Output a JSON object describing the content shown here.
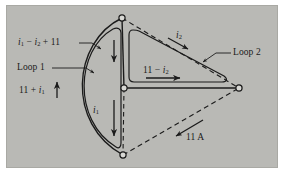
{
  "figure": {
    "type": "circuit-mesh-diagram",
    "background_color": "#b9b9b5",
    "line_color": "#1b1b1b",
    "panel": {
      "x": 6,
      "y": 5,
      "width": 272,
      "height": 163
    },
    "nodes": [
      {
        "name": "top-node",
        "x": 122,
        "y": 18
      },
      {
        "name": "center-node",
        "x": 124,
        "y": 88
      },
      {
        "name": "bottom-node",
        "x": 123,
        "y": 155
      },
      {
        "name": "right-node",
        "x": 239,
        "y": 88
      }
    ],
    "branches": [
      {
        "name": "left-arc-outer",
        "style": "solid",
        "from": "top-node",
        "to": "bottom-node"
      },
      {
        "name": "vertical-trunk",
        "style": "solid",
        "from": "top-node",
        "to": "center-node"
      },
      {
        "name": "center-to-right",
        "style": "solid",
        "from": "center-node",
        "to": "right-node"
      },
      {
        "name": "top-to-right",
        "style": "dashed",
        "from": "top-node",
        "to": "right-node"
      },
      {
        "name": "bottom-to-right",
        "style": "dashed",
        "from": "bottom-node",
        "to": "right-node"
      },
      {
        "name": "center-to-bottom",
        "style": "dashed",
        "from": "center-node",
        "to": "bottom-node"
      }
    ],
    "loops": [
      {
        "name": "loop-1",
        "shape": "lens-arc",
        "label": "Loop 1"
      },
      {
        "name": "loop-2",
        "shape": "rounded-triangle",
        "label": "Loop 2"
      }
    ],
    "labels": {
      "i1_minus_i2_plus_11": {
        "text": "i₁ − i₂ + 11",
        "parts": [
          "i",
          "1",
          " − ",
          "i",
          "2",
          " + 11"
        ]
      },
      "loop1": "Loop 1",
      "eleven_plus_i1": "11 + i₁",
      "i1": "i₁",
      "eleven_minus_i2": "11 − i₂",
      "i2": "i₂",
      "loop2": "Loop 2",
      "current_11a": "11 A"
    },
    "arrows": [
      {
        "name": "arrow-11-plus-i1",
        "direction": "up",
        "at": "left-of-trunk"
      },
      {
        "name": "arrow-i1-down",
        "direction": "down",
        "at": "trunk-lower"
      },
      {
        "name": "arrow-loop1-upper",
        "direction": "down",
        "at": "trunk-upper"
      },
      {
        "name": "arrow-11-minus-i2",
        "direction": "right",
        "at": "center-branch"
      },
      {
        "name": "arrow-i2",
        "direction": "down-right",
        "at": "top-right-dashed"
      },
      {
        "name": "arrow-11a",
        "direction": "down-left",
        "at": "bottom-right-dashed"
      }
    ]
  }
}
